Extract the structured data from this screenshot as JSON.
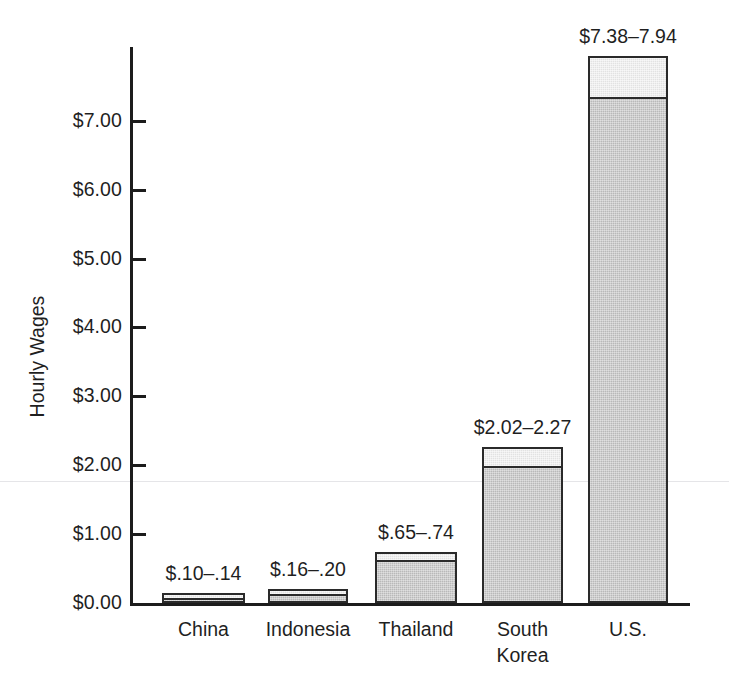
{
  "chart_data": {
    "type": "bar",
    "title": "",
    "xlabel": "",
    "ylabel": "Hourly Wages",
    "ylim": [
      0,
      8.1
    ],
    "grid": false,
    "legend": null,
    "categories": [
      "China",
      "Indonesia",
      "Thailand",
      "South\nKorea",
      "U.S."
    ],
    "tick_labels": [
      "$0.00",
      "$1.00",
      "$2.00",
      "$3.00",
      "$4.00",
      "$5.00",
      "$6.00",
      "$7.00"
    ],
    "tick_values": [
      0,
      1,
      2,
      3,
      4,
      5,
      6,
      7
    ],
    "series": [
      {
        "name": "Low estimate",
        "values": [
          0.1,
          0.16,
          0.65,
          2.02,
          7.38
        ]
      },
      {
        "name": "High estimate",
        "values": [
          0.14,
          0.2,
          0.74,
          2.27,
          7.94
        ]
      }
    ],
    "data_labels": [
      "$.10–.14",
      "$.16–.20",
      "$.65–.74",
      "$2.02–2.27",
      "$7.38–7.94"
    ],
    "colors": {
      "bar_fill": "#b9b9b9",
      "bar_top_fill": "#e2e2e2",
      "bar_outline": "#2a2a2a",
      "axis": "#1c1c1c",
      "text": "#1f1f1f",
      "background": "#ffffff"
    }
  },
  "axis": {
    "y_title": "Hourly Wages",
    "ticks": [
      {
        "label": "$7.00",
        "value": 7
      },
      {
        "label": "$6.00",
        "value": 6
      },
      {
        "label": "$5.00",
        "value": 5
      },
      {
        "label": "$4.00",
        "value": 4
      },
      {
        "label": "$3.00",
        "value": 3
      },
      {
        "label": "$2.00",
        "value": 2
      },
      {
        "label": "$1.00",
        "value": 1
      },
      {
        "label": "$0.00",
        "value": 0
      }
    ]
  },
  "bars": [
    {
      "category": "China",
      "label": "$.10–.14",
      "low": 0.1,
      "high": 0.14
    },
    {
      "category": "Indonesia",
      "label": "$.16–.20",
      "low": 0.16,
      "high": 0.2
    },
    {
      "category": "Thailand",
      "label": "$.65–.74",
      "low": 0.65,
      "high": 0.74
    },
    {
      "category": "South\nKorea",
      "label": "$2.02–2.27",
      "low": 2.02,
      "high": 2.27
    },
    {
      "category": "U.S.",
      "label": "$7.38–7.94",
      "low": 7.38,
      "high": 7.94
    }
  ]
}
